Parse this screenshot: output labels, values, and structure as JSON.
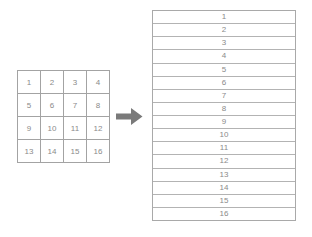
{
  "colors": {
    "background": "#ffffff",
    "grid_border": "#a3a3a3",
    "list_border": "#aeaeae",
    "text": "#8a8a8a",
    "arrow": "#7a7a7a"
  },
  "grid": {
    "rows": [
      [
        "1",
        "2",
        "3",
        "4"
      ],
      [
        "5",
        "6",
        "7",
        "8"
      ],
      [
        "9",
        "10",
        "11",
        "12"
      ],
      [
        "13",
        "14",
        "15",
        "16"
      ]
    ]
  },
  "arrow": {
    "direction": "right",
    "color": "#7a7a7a"
  },
  "list": {
    "items": [
      "1",
      "2",
      "3",
      "4",
      "5",
      "6",
      "7",
      "8",
      "9",
      "10",
      "11",
      "12",
      "13",
      "14",
      "15",
      "16"
    ]
  }
}
